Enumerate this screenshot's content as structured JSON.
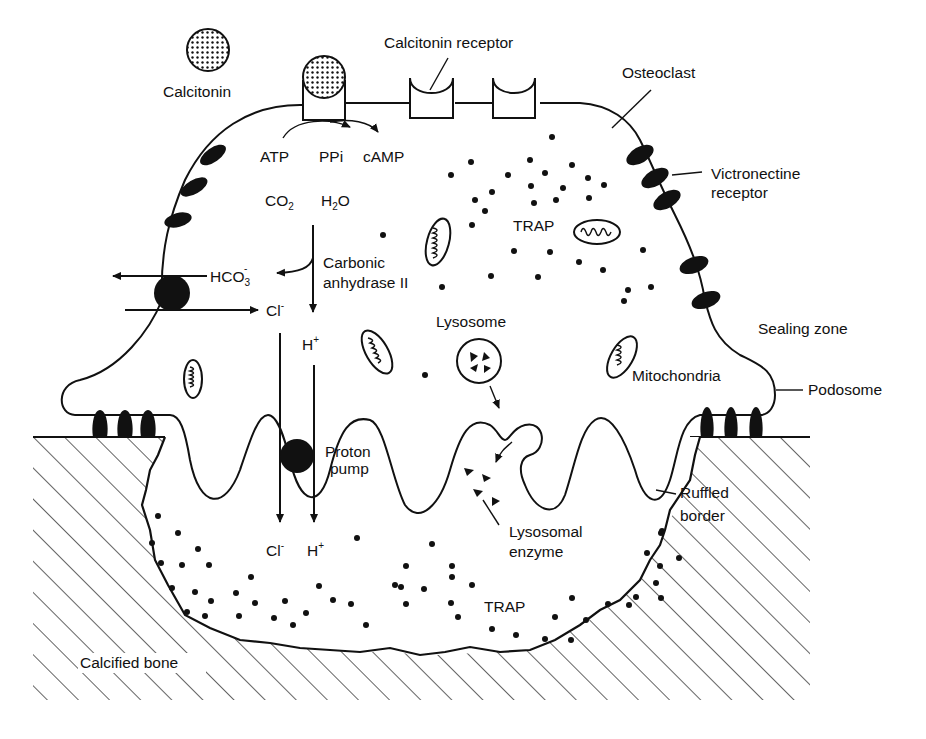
{
  "diagram": {
    "labels": {
      "calcitonin": "Calcitonin",
      "calcitonin_receptor": "Calcitonin receptor",
      "osteoclast": "Osteoclast",
      "victronectine_receptor_line1": "Victronectine",
      "victronectine_receptor_line2": "receptor",
      "atp": "ATP",
      "ppi": "PPi",
      "camp": "cAMP",
      "co2": "CO",
      "co2_sub": "2",
      "h2o_h": "H",
      "h2o_sub": "2",
      "h2o_o": "O",
      "carbonic_line1": "Carbonic",
      "carbonic_line2": "anhydrase II",
      "hco3": "HCO",
      "hco3_sub": "3",
      "hco3_sup": "-",
      "cl_top": "Cl",
      "cl_top_sup": "-",
      "h_top": "H",
      "h_top_sup": "+",
      "trap_top": "TRAP",
      "lysosome": "Lysosome",
      "mitochondria": "Mitochondria",
      "sealing_zone": "Sealing zone",
      "podosome": "Podosome",
      "proton_pump_line1": "Proton",
      "proton_pump_line2": "pump",
      "ruffled_line1": "Ruffled",
      "ruffled_line2": "border",
      "lysosomal_line1": "Lysosomal",
      "lysosomal_line2": "enzyme",
      "cl_bottom": "Cl",
      "cl_bottom_sup": "-",
      "h_bottom": "H",
      "h_bottom_sup": "+",
      "trap_bottom": "TRAP",
      "calcified_bone": "Calcified bone"
    },
    "colors": {
      "ink": "#111111",
      "background": "#ffffff"
    }
  }
}
